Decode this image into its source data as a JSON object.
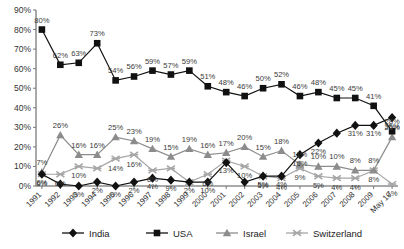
{
  "chart_data": {
    "type": "line",
    "title": "",
    "subtitle": "",
    "xlabel": "",
    "ylabel": "",
    "ylim": [
      0,
      90
    ],
    "yticks": [
      "0%",
      "10%",
      "20%",
      "30%",
      "40%",
      "50%",
      "60%",
      "70%",
      "80%",
      "90%"
    ],
    "ytick_values": [
      0,
      10,
      20,
      30,
      40,
      50,
      60,
      70,
      80,
      90
    ],
    "grid": false,
    "legend_position": "bottom",
    "categories": [
      "1991",
      "1992",
      "1993",
      "1994",
      "1995",
      "1996",
      "1997",
      "1998",
      "1999",
      "2000",
      "2001",
      "2002",
      "2003",
      "2004",
      "2005",
      "2006",
      "2007",
      "2008",
      "2009",
      "May 10"
    ],
    "series": [
      {
        "name": "India",
        "marker": "diamond",
        "color": "#111111",
        "values": [
          6,
          1,
          0,
          2,
          0,
          2,
          4,
          3,
          2,
          2,
          12,
          2,
          5,
          5,
          16,
          22,
          27,
          31,
          31,
          35
        ],
        "labels": [
          "6%",
          "",
          "0%",
          "2%",
          "0%",
          "2%",
          "4%",
          "9%",
          "2%",
          "10%",
          "",
          "",
          "5%",
          "4%",
          "16%",
          "22%",
          "",
          "31%",
          "31%",
          "35%"
        ]
      },
      {
        "name": "USA",
        "marker": "square",
        "color": "#111111",
        "values": [
          80,
          62,
          63,
          73,
          54,
          56,
          59,
          57,
          59,
          51,
          48,
          46,
          50,
          52,
          46,
          48,
          45,
          45,
          41,
          28
        ],
        "labels": [
          "80%",
          "62%",
          "63%",
          "73%",
          "54%",
          "56%",
          "59%",
          "57%",
          "59%",
          "51%",
          "48%",
          "46%",
          "50%",
          "52%",
          "46%",
          "48%",
          "45%",
          "45%",
          "41%",
          "28%"
        ]
      },
      {
        "name": "Israel",
        "marker": "triangle",
        "color": "#8c8c8c",
        "values": [
          7,
          26,
          16,
          16,
          25,
          23,
          19,
          15,
          19,
          16,
          17,
          20,
          15,
          18,
          11,
          10,
          10,
          8,
          8,
          25
        ],
        "labels": [
          "7%",
          "26%",
          "16%",
          "16%",
          "25%",
          "23%",
          "19%",
          "15%",
          "19%",
          "16%",
          "17%",
          "20%",
          "15%",
          "18%",
          "11%",
          "10%",
          "10%",
          "8%",
          "8%",
          "25%"
        ]
      },
      {
        "name": "Switzerland",
        "marker": "star",
        "color": "#a6a6a6",
        "values": [
          6,
          6,
          10,
          9,
          14,
          16,
          8,
          9,
          2,
          6,
          13,
          10,
          5,
          4,
          9,
          5,
          4,
          4,
          8,
          1
        ],
        "labels": [
          "6%",
          "6%",
          "10%",
          "",
          "14%",
          "16%",
          "8%",
          "",
          "",
          "6%",
          "13%",
          "10%",
          "5%",
          "4%",
          "9%",
          "5%",
          "4%",
          "4%",
          "8%",
          "1%"
        ]
      }
    ]
  },
  "legend": {
    "items": [
      {
        "label": "India",
        "marker": "diamond",
        "color": "#111111"
      },
      {
        "label": "USA",
        "marker": "square",
        "color": "#111111"
      },
      {
        "label": "Israel",
        "marker": "triangle",
        "color": "#8c8c8c"
      },
      {
        "label": "Switzerland",
        "marker": "star",
        "color": "#a6a6a6"
      }
    ]
  }
}
